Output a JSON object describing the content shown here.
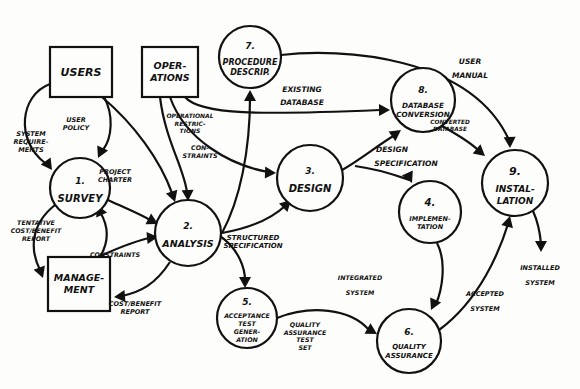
{
  "diagram": {
    "type": "data-flow-diagram",
    "colors": {
      "ink": "#111111",
      "paper": "#fdfdfb"
    },
    "external_entities": [
      {
        "id": "users",
        "lines": [
          "USERS"
        ]
      },
      {
        "id": "operations",
        "lines": [
          "OPER-",
          "ATIONS"
        ]
      },
      {
        "id": "management",
        "lines": [
          "MANAGE-",
          "MENT"
        ]
      }
    ],
    "processes": [
      {
        "id": "p1",
        "number": "1.",
        "lines": [
          "SURVEY"
        ]
      },
      {
        "id": "p2",
        "number": "2.",
        "lines": [
          "ANALYSIS"
        ]
      },
      {
        "id": "p3",
        "number": "3.",
        "lines": [
          "DESIGN"
        ]
      },
      {
        "id": "p4",
        "number": "4.",
        "lines": [
          "IMPLEMEN-",
          "TATION"
        ]
      },
      {
        "id": "p5",
        "number": "5.",
        "lines": [
          "ACCEPTANCE",
          "TEST",
          "GENER-",
          "ATION"
        ]
      },
      {
        "id": "p6",
        "number": "6.",
        "lines": [
          "QUALITY",
          "ASSURANCE"
        ]
      },
      {
        "id": "p7",
        "number": "7.",
        "lines": [
          "PROCEDURE",
          "DESCRIP."
        ]
      },
      {
        "id": "p8",
        "number": "8.",
        "lines": [
          "DATABASE",
          "CONVERSION"
        ]
      },
      {
        "id": "p9",
        "number": "9.",
        "lines": [
          "INSTAL-",
          "LATION"
        ]
      }
    ],
    "flows": [
      {
        "id": "system-requirements",
        "from": "users",
        "to": "p1",
        "lines": [
          "SYSTEM",
          "REQUIRE-",
          "MENTS"
        ]
      },
      {
        "id": "user-policy",
        "from": "users",
        "to": "p1",
        "lines": [
          "USER",
          "POLICY"
        ]
      },
      {
        "id": "users-to-analysis",
        "from": "users",
        "to": "p2",
        "lines": []
      },
      {
        "id": "project-charter",
        "from": "p1",
        "to": "p2",
        "lines": [
          "PROJECT",
          "CHARTER"
        ]
      },
      {
        "id": "tentative-cost-benefit",
        "from": "p1",
        "to": "management",
        "lines": [
          "TENTATIVE",
          "COST/BENEFIT",
          "REPORT"
        ]
      },
      {
        "id": "management-to-survey",
        "from": "management",
        "to": "p1",
        "lines": []
      },
      {
        "id": "constraints-mgmt",
        "from": "management",
        "to": "p2",
        "lines": [
          "CONSTRAINTS"
        ]
      },
      {
        "id": "cost-benefit-report",
        "from": "p2",
        "to": "management",
        "lines": [
          "COST/BENEFIT",
          "REPORT"
        ]
      },
      {
        "id": "constraints-ops",
        "from": "operations",
        "to": "p2",
        "lines": [
          "CON-",
          "STRAINTS"
        ]
      },
      {
        "id": "operational-restrictions",
        "from": "operations",
        "to": "p3",
        "lines": [
          "OPERATIONAL",
          "RESTRIC-",
          "TIONS"
        ]
      },
      {
        "id": "existing-database",
        "from": "operations",
        "to": "p8",
        "lines": [
          "EXISTING",
          "DATABASE"
        ]
      },
      {
        "id": "analysis-to-procedure",
        "from": "p2",
        "to": "p7",
        "lines": []
      },
      {
        "id": "structured-specification",
        "from": "p2",
        "to": "p3",
        "lines": [
          "STRUCTURED",
          "SPECIFICATION"
        ]
      },
      {
        "id": "analysis-to-acceptance",
        "from": "p2",
        "to": "p5",
        "lines": []
      },
      {
        "id": "design-specification",
        "from": "p3",
        "to": "p8",
        "lines": [
          "DESIGN",
          "SPECIFICATION"
        ]
      },
      {
        "id": "design-to-implementation",
        "from": "p3",
        "to": "p4",
        "lines": []
      },
      {
        "id": "user-manual",
        "from": "p7",
        "to": "p9",
        "lines": [
          "USER",
          "MANUAL"
        ]
      },
      {
        "id": "converted-database",
        "from": "p8",
        "to": "p9",
        "lines": [
          "CONVERTED",
          "DATABASE"
        ]
      },
      {
        "id": "integrated-system",
        "from": "p4",
        "to": "p6",
        "lines": [
          "INTEGRATED",
          "SYSTEM"
        ]
      },
      {
        "id": "qa-test-set",
        "from": "p5",
        "to": "p6",
        "lines": [
          "QUALITY",
          "ASSURANCE",
          "TEST",
          "SET"
        ]
      },
      {
        "id": "accepted-system",
        "from": "p6",
        "to": "p9",
        "lines": [
          "ACCEPTED",
          "SYSTEM"
        ]
      },
      {
        "id": "installed-system",
        "from": "p9",
        "to": null,
        "lines": [
          "INSTALLED",
          "SYSTEM"
        ]
      }
    ]
  }
}
